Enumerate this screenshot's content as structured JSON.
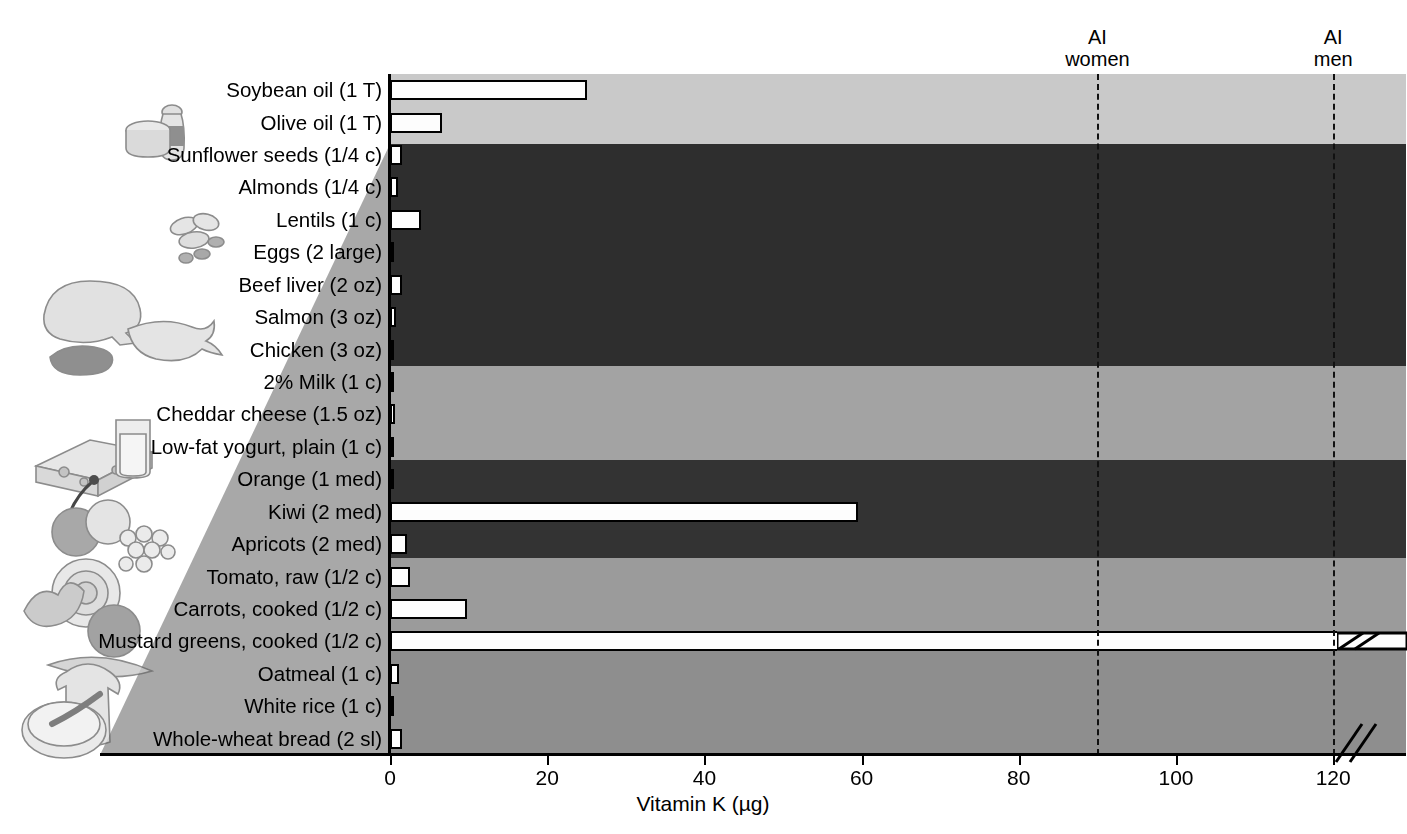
{
  "chart_data": {
    "type": "bar",
    "orientation": "horizontal",
    "title": "",
    "xlabel": "Vitamin K (µg)",
    "ylabel": "",
    "xlim": [
      0,
      125
    ],
    "xticks": [
      0,
      20,
      40,
      60,
      80,
      100,
      120
    ],
    "xticklabels": [
      "0",
      "20",
      "40",
      "60",
      "80",
      "100",
      "120"
    ],
    "grid": false,
    "legend": "none",
    "axis_break": true,
    "axis_break_note": "Axis is broken just past 120 µg; the mustard greens bar is truncated with a break symbol.",
    "categories": [
      "Soybean oil (1 T)",
      "Olive oil (1 T)",
      "Sunflower seeds (1/4 c)",
      "Almonds (1/4 c)",
      "Lentils (1 c)",
      "Eggs (2 large)",
      "Beef liver (2 oz)",
      "Salmon (3 oz)",
      "Chicken (3 oz)",
      "2% Milk (1 c)",
      "Cheddar cheese (1.5 oz)",
      "Low-fat yogurt, plain (1 c)",
      "Orange (1 med)",
      "Kiwi (2 med)",
      "Apricots (2 med)",
      "Tomato, raw (1/2 c)",
      "Carrots, cooked (1/2 c)",
      "Mustard greens, cooked (1/2 c)",
      "Oatmeal (1 c)",
      "White rice (1 c)",
      "Whole-wheat bread (2 sl)"
    ],
    "values": [
      25,
      6.6,
      1.5,
      1.0,
      4.0,
      0.3,
      1.5,
      0.8,
      0.2,
      0.5,
      0.6,
      0.3,
      0.1,
      59.5,
      2.2,
      2.5,
      9.8,
      125,
      1.2,
      0.1,
      1.5
    ],
    "annotations": [
      {
        "label": "AI women",
        "value": 90,
        "style": "dashed vertical line"
      },
      {
        "label": "AI men",
        "value": 120,
        "style": "dashed vertical line"
      }
    ]
  },
  "reference_lines": [
    {
      "name": "ai-women",
      "line1": "AI",
      "line2": "women",
      "value": 90
    },
    {
      "name": "ai-men",
      "line1": "AI",
      "line2": "men",
      "value": 120
    }
  ],
  "food_groups": [
    {
      "name": "oils",
      "first": 0,
      "last": 1,
      "color": "#c9c9c9"
    },
    {
      "name": "protein",
      "first": 2,
      "last": 8,
      "color": "#2e2e2e"
    },
    {
      "name": "dairy",
      "first": 9,
      "last": 11,
      "color": "#a3a3a3"
    },
    {
      "name": "fruits",
      "first": 12,
      "last": 14,
      "color": "#333333"
    },
    {
      "name": "vegetables",
      "first": 15,
      "last": 17,
      "color": "#9b9b9b"
    },
    {
      "name": "grains",
      "first": 18,
      "last": 20,
      "color": "#8e8e8e"
    }
  ],
  "rows": [
    {
      "label": "Soybean oil (1 T)",
      "value": 25,
      "group": "oils",
      "art": "oil-bottle-and-tub"
    },
    {
      "label": "Olive oil (1 T)",
      "value": 6.6,
      "group": "oils",
      "art": ""
    },
    {
      "label": "Sunflower seeds (1/4 c)",
      "value": 1.5,
      "group": "protein",
      "art": ""
    },
    {
      "label": "Almonds (1/4 c)",
      "value": 1.0,
      "group": "protein",
      "art": ""
    },
    {
      "label": "Lentils (1 c)",
      "value": 4.0,
      "group": "protein",
      "art": "nuts-and-legumes"
    },
    {
      "label": "Eggs (2 large)",
      "value": 0.3,
      "group": "protein",
      "art": ""
    },
    {
      "label": "Beef liver (2 oz)",
      "value": 1.5,
      "group": "protein",
      "art": "poultry-fish-and-meat"
    },
    {
      "label": "Salmon (3 oz)",
      "value": 0.8,
      "group": "protein",
      "art": ""
    },
    {
      "label": "Chicken (3 oz)",
      "value": 0.2,
      "group": "protein",
      "art": ""
    },
    {
      "label": "2% Milk (1 c)",
      "value": 0.5,
      "group": "dairy",
      "art": "cheese-and-milk"
    },
    {
      "label": "Cheddar cheese (1.5 oz)",
      "value": 0.6,
      "group": "dairy",
      "art": ""
    },
    {
      "label": "Low-fat yogurt, plain (1 c)",
      "value": 0.3,
      "group": "dairy",
      "art": ""
    },
    {
      "label": "Orange (1 med)",
      "value": 0.1,
      "group": "fruits",
      "art": "assorted-fruit"
    },
    {
      "label": "Kiwi (2 med)",
      "value": 59.5,
      "group": "fruits",
      "art": ""
    },
    {
      "label": "Apricots (2 med)",
      "value": 2.2,
      "group": "fruits",
      "art": ""
    },
    {
      "label": "Tomato, raw (1/2 c)",
      "value": 2.5,
      "group": "vegetables",
      "art": "assorted-vegetables"
    },
    {
      "label": "Carrots, cooked (1/2 c)",
      "value": 9.8,
      "group": "vegetables",
      "art": ""
    },
    {
      "label": "Mustard greens, cooked (1/2 c)",
      "value": 125,
      "group": "vegetables",
      "art": "",
      "broken": true
    },
    {
      "label": "Oatmeal (1 c)",
      "value": 1.2,
      "group": "grains",
      "art": "bread-and-cereal"
    },
    {
      "label": "White rice (1 c)",
      "value": 0.1,
      "group": "grains",
      "art": ""
    },
    {
      "label": "Whole-wheat bread (2 sl)",
      "value": 1.5,
      "group": "grains",
      "art": ""
    }
  ],
  "axis": {
    "xtitle": "Vitamin K (µg)",
    "ticklabels": [
      "0",
      "20",
      "40",
      "60",
      "80",
      "100",
      "120"
    ]
  },
  "colors": {
    "oils": "#c9c9c9",
    "protein": "#2e2e2e",
    "dairy": "#a3a3a3",
    "fruits": "#333333",
    "vegetables": "#9b9b9b",
    "grains": "#8e8e8e",
    "bar_fill": "#fdfdfd",
    "bar_stroke": "#000000",
    "wedge": "#a8a8a8",
    "axis": "#000000"
  }
}
